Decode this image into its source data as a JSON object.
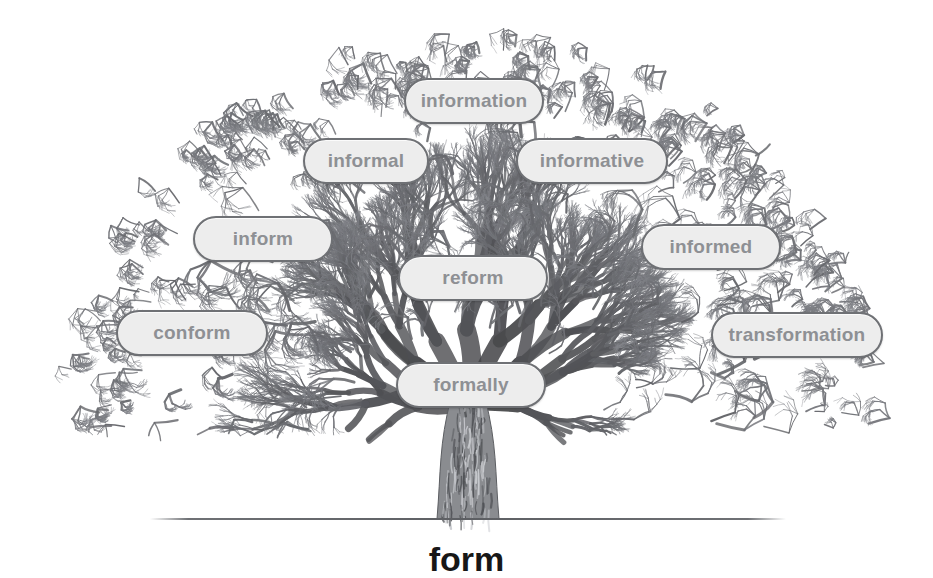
{
  "diagram": {
    "type": "word-family-tree",
    "root_word": "form",
    "canvas": {
      "width": 933,
      "height": 578
    },
    "ground_line": {
      "x1": 150,
      "x2": 786,
      "y": 518
    },
    "root_label": {
      "text": "form",
      "x": 468,
      "y": 540,
      "font_size": 34
    },
    "colors": {
      "pill_fill": "#ededed",
      "pill_border": "#6f7175",
      "pill_text": "#8e9094",
      "branch": "#6b6d71",
      "trunk": "#75777b",
      "root_text": "#171717",
      "background": "#ffffff"
    },
    "words": [
      {
        "label": "information",
        "x": 404,
        "y": 78,
        "w": 136,
        "h": 42,
        "font_size": 19
      },
      {
        "label": "informal",
        "x": 303,
        "y": 138,
        "w": 122,
        "h": 42,
        "font_size": 19
      },
      {
        "label": "informative",
        "x": 516,
        "y": 138,
        "w": 148,
        "h": 42,
        "font_size": 19
      },
      {
        "label": "inform",
        "x": 193,
        "y": 216,
        "w": 136,
        "h": 42,
        "font_size": 19
      },
      {
        "label": "informed",
        "x": 641,
        "y": 224,
        "w": 136,
        "h": 42,
        "font_size": 19
      },
      {
        "label": "reform",
        "x": 398,
        "y": 255,
        "w": 146,
        "h": 42,
        "font_size": 19
      },
      {
        "label": "conform",
        "x": 116,
        "y": 310,
        "w": 148,
        "h": 42,
        "font_size": 19
      },
      {
        "label": "transformation",
        "x": 711,
        "y": 312,
        "w": 168,
        "h": 42,
        "font_size": 19
      },
      {
        "label": "formally",
        "x": 396,
        "y": 362,
        "w": 146,
        "h": 42,
        "font_size": 19
      }
    ]
  }
}
